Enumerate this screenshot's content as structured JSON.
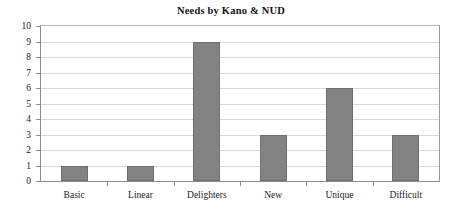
{
  "chart_data": {
    "type": "bar",
    "title": "Needs by Kano & NUD",
    "xlabel": "",
    "ylabel": "",
    "categories": [
      "Basic",
      "Linear",
      "Delighters",
      "New",
      "Unique",
      "Difficult"
    ],
    "values": [
      1,
      1,
      9,
      3,
      6,
      3
    ],
    "ylim": [
      0,
      10
    ],
    "ytick_labels": [
      "0",
      "1",
      "2",
      "3",
      "4",
      "5",
      "6",
      "7",
      "8",
      "9",
      "10"
    ],
    "ytick_values": [
      0,
      1,
      2,
      3,
      4,
      5,
      6,
      7,
      8,
      9,
      10
    ],
    "grid": true,
    "grid_axis": "y",
    "legend": false,
    "legend_position": "none",
    "bar_color": "#828282",
    "bar_border_color": "#6e6e6e",
    "grid_color": "#d9d9d9",
    "axis_color": "#8c8c8c",
    "background_color": "#ffffff"
  }
}
